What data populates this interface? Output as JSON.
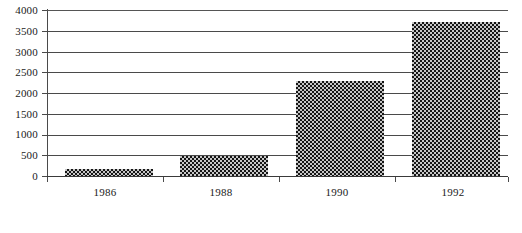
{
  "chart_data": {
    "type": "bar",
    "title": "",
    "subtitle": "",
    "xlabel": "",
    "ylabel": "",
    "categories": [
      "1986",
      "1988",
      "1990",
      "1992"
    ],
    "values": [
      170,
      480,
      2300,
      3720
    ],
    "series": [
      {
        "name": "",
        "values": [
          170,
          480,
          2300,
          3720
        ]
      }
    ],
    "ylim": [
      0,
      4000
    ],
    "ytick_labels": [
      "0",
      "500",
      "1000",
      "1500",
      "2000",
      "2500",
      "3000",
      "3500",
      "4000"
    ],
    "ytick_values": [
      0,
      500,
      1000,
      1500,
      2000,
      2500,
      3000,
      3500,
      4000
    ],
    "grid": true,
    "grid_axis": "y",
    "legend": false,
    "legend_position": "none",
    "bar_fill": "checkerboard-pattern",
    "bar_color": "#3a3a3a",
    "axis_color": "#4a4a4a",
    "background": "#ffffff",
    "annotations": []
  },
  "caption": {
    "text": ""
  }
}
